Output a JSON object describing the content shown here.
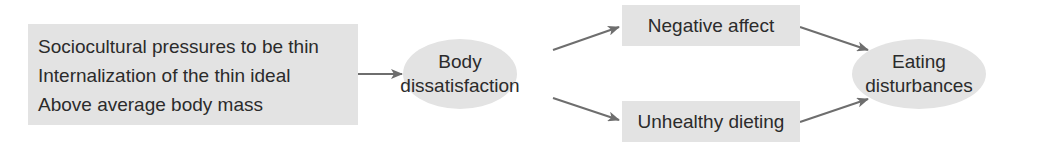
{
  "diagram": {
    "type": "flow-model",
    "colors": {
      "node_fill": "#e3e3e3",
      "arrow": "#6e6e6e",
      "text": "#2b2b2b"
    },
    "risk_factors_box": {
      "lines": [
        "Sociocultural pressures to be thin",
        "Internalization of the thin ideal",
        "Above average body mass"
      ]
    },
    "body_dissatisfaction": {
      "line1": "Body",
      "line2": "dissatisfaction"
    },
    "negative_affect": {
      "label": "Negative affect"
    },
    "unhealthy_dieting": {
      "label": "Unhealthy dieting"
    },
    "eating_disturbances": {
      "line1": "Eating",
      "line2": "disturbances"
    },
    "edges": [
      {
        "from": "risk_factors_box",
        "to": "body_dissatisfaction"
      },
      {
        "from": "body_dissatisfaction",
        "to": "negative_affect"
      },
      {
        "from": "body_dissatisfaction",
        "to": "unhealthy_dieting"
      },
      {
        "from": "negative_affect",
        "to": "eating_disturbances"
      },
      {
        "from": "unhealthy_dieting",
        "to": "eating_disturbances"
      }
    ]
  }
}
